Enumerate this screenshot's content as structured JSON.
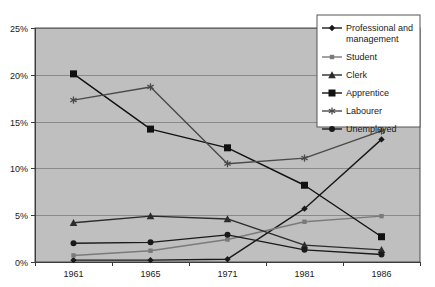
{
  "chart_data": {
    "type": "line",
    "title": "",
    "subtitle": "",
    "xlabel": "",
    "ylabel": "",
    "categories": [
      "1961",
      "1965",
      "1971",
      "1981",
      "1986"
    ],
    "x_tick_labels": [
      "1961",
      "1965",
      "1971",
      "1981",
      "1986"
    ],
    "y_tick_labels": [
      "0%",
      "5%",
      "10%",
      "15%",
      "20%",
      "25%"
    ],
    "y_tick_values": [
      0,
      5,
      10,
      15,
      20,
      25
    ],
    "ylim": [
      0,
      25
    ],
    "grid": "horizontal",
    "legend_position": "top-right",
    "plot_background": "#bfbfbf",
    "series": [
      {
        "name": "Professional and management",
        "legend_label_line1": "Professional and",
        "legend_label_line2": "management",
        "marker": "diamond",
        "color": "#1a1a1a",
        "values": [
          0.2,
          0.2,
          0.3,
          5.7,
          13.1
        ]
      },
      {
        "name": "Student",
        "legend_label_line1": "Student",
        "legend_label_line2": "",
        "marker": "square-small",
        "color": "#7a7a7a",
        "values": [
          0.7,
          1.2,
          2.4,
          4.3,
          4.9
        ]
      },
      {
        "name": "Clerk",
        "legend_label_line1": "Clerk",
        "legend_label_line2": "",
        "marker": "triangle",
        "color": "#2b2b2b",
        "values": [
          4.2,
          4.9,
          4.6,
          1.8,
          1.3
        ]
      },
      {
        "name": "Apprentice",
        "legend_label_line1": "Apprentice",
        "legend_label_line2": "",
        "marker": "square-large",
        "color": "#111111",
        "values": [
          20.1,
          14.2,
          12.2,
          8.2,
          2.7
        ]
      },
      {
        "name": "Labourer",
        "legend_label_line1": "Labourer",
        "legend_label_line2": "",
        "marker": "asterisk",
        "color": "#4a4a4a",
        "values": [
          17.3,
          18.7,
          10.5,
          11.1,
          14.0
        ]
      },
      {
        "name": "Unemployed",
        "legend_label_line1": "Unemployed",
        "legend_label_line2": "",
        "marker": "circle",
        "color": "#1a1a1a",
        "values": [
          2.0,
          2.1,
          2.9,
          1.3,
          0.8
        ]
      }
    ]
  }
}
